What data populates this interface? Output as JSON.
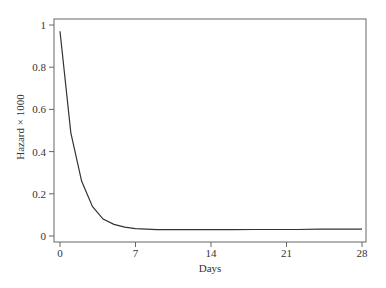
{
  "chart_data": {
    "type": "line",
    "title": "",
    "xlabel": "Days",
    "ylabel": "Hazard × 1000",
    "xlim": [
      0,
      28
    ],
    "ylim": [
      0,
      1
    ],
    "x_ticks": [
      0,
      7,
      14,
      21,
      28
    ],
    "x_tick_labels": [
      "0",
      "7",
      "14",
      "21",
      "28"
    ],
    "y_ticks": [
      0,
      0.2,
      0.4,
      0.6,
      0.8,
      1
    ],
    "y_tick_labels": [
      "0",
      "0.2",
      "0.4",
      "0.6",
      "0.8",
      "1"
    ],
    "grid": false,
    "legend": null,
    "series": [
      {
        "name": "Hazard",
        "color": "#333333",
        "x": [
          0,
          1,
          2,
          3,
          4,
          5,
          6,
          7,
          8,
          9,
          10,
          12,
          14,
          16,
          18,
          20,
          21,
          22,
          24,
          26,
          28
        ],
        "values": [
          0.97,
          0.49,
          0.26,
          0.14,
          0.08,
          0.055,
          0.042,
          0.035,
          0.032,
          0.03,
          0.03,
          0.03,
          0.03,
          0.03,
          0.031,
          0.031,
          0.031,
          0.031,
          0.032,
          0.032,
          0.032
        ]
      }
    ]
  }
}
